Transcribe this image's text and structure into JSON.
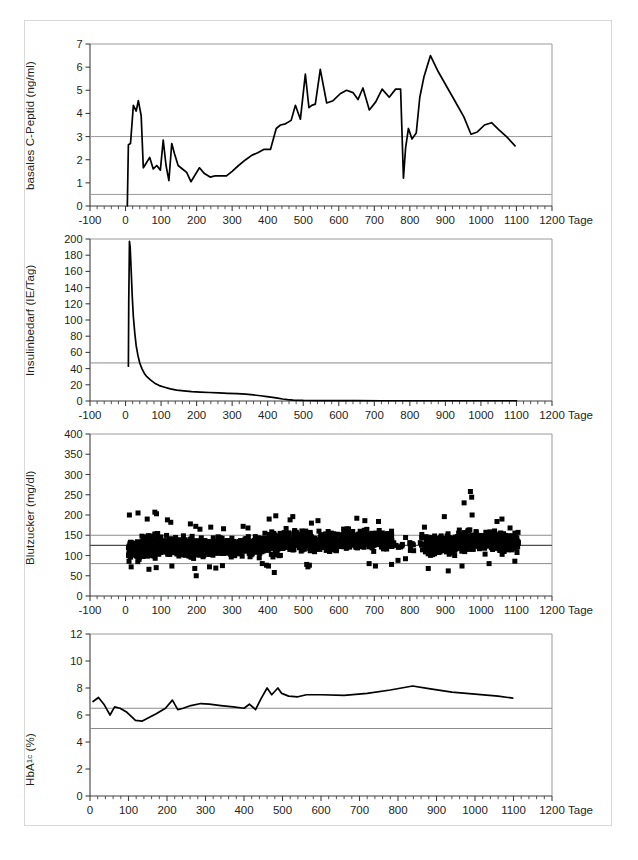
{
  "figure": {
    "background": "#ffffff",
    "border_color": "#d8d8d8",
    "line_color": "#000000",
    "ref_line_color": "#8c8c8c",
    "ref_line_dark_color": "#4d4d4d",
    "axis_color": "#3f3f3f",
    "x_unit_label": "Tage"
  },
  "chart_data": [
    {
      "id": "c-peptid",
      "type": "line",
      "title": "",
      "ylabel": "basales C-Peptid (ng/ml)",
      "xlabel": "Tage",
      "xlim": [
        -100,
        1200
      ],
      "ylim": [
        0,
        7
      ],
      "xticks": [
        -100,
        0,
        100,
        200,
        300,
        400,
        500,
        600,
        700,
        800,
        900,
        1000,
        1100,
        1200
      ],
      "xticklabels": [
        "-100",
        "0",
        "100",
        "200",
        "300",
        "400",
        "500",
        "600",
        "700",
        "800",
        "900",
        "1000",
        "1100",
        "1200"
      ],
      "yticks": [
        0,
        1,
        2,
        3,
        4,
        5,
        6,
        7
      ],
      "yticklabels": [
        "0",
        "1",
        "2",
        "3",
        "4",
        "5",
        "6",
        "7"
      ],
      "minor_tick_step": 20,
      "grid": false,
      "reference_lines": [
        {
          "y": 3.0,
          "color": "#9a9a9a"
        },
        {
          "y": 0.5,
          "color": "#9a9a9a"
        }
      ],
      "x": [
        5,
        8,
        14,
        22,
        30,
        36,
        44,
        50,
        58,
        68,
        78,
        88,
        98,
        106,
        114,
        122,
        130,
        138,
        148,
        160,
        172,
        184,
        196,
        208,
        222,
        238,
        252,
        268,
        284,
        300,
        318,
        338,
        356,
        372,
        390,
        408,
        424,
        436,
        450,
        466,
        478,
        492,
        506,
        516,
        524,
        534,
        548,
        566,
        584,
        604,
        622,
        640,
        654,
        668,
        686,
        704,
        722,
        742,
        760,
        774,
        782,
        788,
        796,
        806,
        818,
        828,
        840,
        858,
        880,
        906,
        930,
        952,
        972,
        990,
        1010,
        1030,
        1050,
        1072,
        1096
      ],
      "y": [
        0.0,
        2.65,
        2.7,
        4.35,
        4.1,
        4.55,
        3.9,
        1.65,
        1.85,
        2.1,
        1.6,
        1.75,
        1.55,
        2.85,
        1.75,
        1.1,
        2.7,
        2.25,
        1.75,
        1.6,
        1.45,
        1.05,
        1.35,
        1.65,
        1.4,
        1.25,
        1.3,
        1.3,
        1.3,
        1.5,
        1.75,
        2.0,
        2.2,
        2.3,
        2.45,
        2.45,
        3.35,
        3.5,
        3.55,
        3.7,
        4.35,
        3.75,
        5.7,
        4.25,
        4.35,
        4.4,
        5.9,
        4.45,
        4.55,
        4.85,
        5.0,
        4.9,
        4.6,
        5.1,
        4.15,
        4.5,
        5.05,
        4.7,
        5.05,
        5.05,
        1.2,
        2.5,
        3.35,
        2.9,
        3.15,
        4.7,
        5.6,
        6.5,
        5.8,
        5.1,
        4.45,
        3.85,
        3.1,
        3.2,
        3.5,
        3.6,
        3.3,
        3.0,
        2.6
      ]
    },
    {
      "id": "insulinbedarf",
      "type": "line",
      "title": "",
      "ylabel": "Insulinbedarf (IE/Tag)",
      "xlabel": "Tage",
      "xlim": [
        -100,
        1200
      ],
      "ylim": [
        0,
        200
      ],
      "xticks": [
        -100,
        0,
        100,
        200,
        300,
        400,
        500,
        600,
        700,
        800,
        900,
        1000,
        1100,
        1200
      ],
      "xticklabels": [
        "-100",
        "0",
        "100",
        "200",
        "300",
        "400",
        "500",
        "600",
        "700",
        "800",
        "900",
        "1000",
        "1100",
        "1200"
      ],
      "yticks": [
        0,
        20,
        40,
        60,
        80,
        100,
        120,
        140,
        160,
        180,
        200
      ],
      "yticklabels": [
        "0",
        "20",
        "40",
        "60",
        "80",
        "100",
        "120",
        "140",
        "160",
        "180",
        "200"
      ],
      "minor_tick_step": 20,
      "grid": false,
      "reference_lines": [
        {
          "y": 47,
          "color": "#8c8c8c"
        }
      ],
      "x": [
        8,
        9,
        11,
        13,
        16,
        19,
        22,
        26,
        30,
        35,
        40,
        46,
        53,
        60,
        70,
        82,
        95,
        110,
        126,
        144,
        164,
        186,
        210,
        236,
        262,
        288,
        314,
        338,
        360,
        380,
        398,
        414,
        428,
        442,
        456,
        472,
        500,
        540,
        590,
        650,
        720,
        800,
        880,
        960,
        1040,
        1100
      ],
      "y": [
        43,
        120,
        197,
        190,
        160,
        128,
        104,
        84,
        68,
        56,
        47,
        40,
        34,
        30,
        26,
        22,
        19,
        17,
        15,
        13.5,
        12.5,
        11.5,
        11,
        10.5,
        10,
        9.5,
        9,
        8.5,
        7.5,
        6.5,
        5.5,
        4.5,
        3.5,
        2.5,
        1.8,
        1.2,
        0.7,
        0.5,
        0.4,
        0.35,
        0.3,
        0.3,
        0.3,
        0.3,
        0.3,
        0.3
      ]
    },
    {
      "id": "blutzucker",
      "type": "scatter",
      "title": "",
      "ylabel": "Blutzucker (mg/dl)",
      "xlabel": "Tage",
      "xlim": [
        -100,
        1200
      ],
      "ylim": [
        0,
        400
      ],
      "xticks": [
        -100,
        0,
        100,
        200,
        300,
        400,
        500,
        600,
        700,
        800,
        900,
        1000,
        1100,
        1200
      ],
      "xticklabels": [
        "-100",
        "0",
        "100",
        "200",
        "300",
        "400",
        "500",
        "600",
        "700",
        "800",
        "900",
        "1000",
        "1100",
        "1200"
      ],
      "yticks": [
        0,
        50,
        100,
        150,
        200,
        250,
        300,
        350,
        400
      ],
      "yticklabels": [
        "0",
        "50",
        "100",
        "150",
        "200",
        "250",
        "300",
        "350",
        "400"
      ],
      "minor_tick_step": 20,
      "grid": false,
      "marker": "square",
      "marker_size": 5,
      "reference_lines": [
        {
          "y": 150,
          "color": "#8c8c8c"
        },
        {
          "y": 125,
          "color": "#4d4d4d"
        },
        {
          "y": 80,
          "color": "#8c8c8c"
        }
      ],
      "point_count": 1600,
      "cloud_segments": [
        {
          "x_start": 8,
          "x_end": 45,
          "mean": 112,
          "spread": 26,
          "density": 120,
          "outliers_high": [
            205,
            200
          ],
          "outliers_low": [
            72
          ]
        },
        {
          "x_start": 45,
          "x_end": 95,
          "mean": 124,
          "spread": 32,
          "density": 150,
          "outliers_high": [
            207,
            203,
            190
          ],
          "outliers_low": [
            70,
            66
          ]
        },
        {
          "x_start": 95,
          "x_end": 150,
          "mean": 123,
          "spread": 30,
          "density": 140,
          "outliers_high": [
            182,
            188
          ],
          "outliers_low": [
            74
          ]
        },
        {
          "x_start": 150,
          "x_end": 200,
          "mean": 120,
          "spread": 29,
          "density": 130,
          "outliers_high": [
            178,
            172
          ],
          "outliers_low": [
            50,
            68
          ]
        },
        {
          "x_start": 200,
          "x_end": 260,
          "mean": 119,
          "spread": 28,
          "density": 135,
          "outliers_high": [
            170,
            165
          ],
          "outliers_low": [
            69,
            72
          ]
        },
        {
          "x_start": 260,
          "x_end": 330,
          "mean": 121,
          "spread": 28,
          "density": 140,
          "outliers_high": [
            166
          ],
          "outliers_low": [
            75
          ]
        },
        {
          "x_start": 330,
          "x_end": 400,
          "mean": 124,
          "spread": 30,
          "density": 140,
          "outliers_high": [
            172,
            168
          ],
          "outliers_low": [
            76,
            80
          ]
        },
        {
          "x_start": 400,
          "x_end": 440,
          "mean": 130,
          "spread": 34,
          "density": 110,
          "outliers_high": [
            198,
            190
          ],
          "outliers_low": [
            58,
            74
          ]
        },
        {
          "x_start": 440,
          "x_end": 510,
          "mean": 136,
          "spread": 33,
          "density": 150,
          "outliers_high": [
            196,
            188
          ],
          "outliers_low": [
            78
          ]
        },
        {
          "x_start": 510,
          "x_end": 600,
          "mean": 133,
          "spread": 32,
          "density": 160,
          "outliers_high": [
            186,
            180
          ],
          "outliers_low": [
            76,
            72
          ]
        },
        {
          "x_start": 600,
          "x_end": 690,
          "mean": 137,
          "spread": 33,
          "density": 165,
          "outliers_high": [
            192,
            186
          ],
          "outliers_low": [
            80
          ]
        },
        {
          "x_start": 690,
          "x_end": 750,
          "mean": 136,
          "spread": 31,
          "density": 120,
          "outliers_high": [
            184
          ],
          "outliers_low": [
            78,
            74
          ]
        },
        {
          "x_start": 750,
          "x_end": 840,
          "mean": 126,
          "spread": 22,
          "density": 18,
          "outliers_high": [
            152
          ],
          "outliers_low": [
            88,
            92
          ]
        },
        {
          "x_start": 840,
          "x_end": 930,
          "mean": 128,
          "spread": 32,
          "density": 150,
          "outliers_high": [
            196,
            170
          ],
          "outliers_low": [
            68,
            62
          ]
        },
        {
          "x_start": 930,
          "x_end": 1000,
          "mean": 136,
          "spread": 34,
          "density": 150,
          "outliers_high": [
            258,
            244,
            230,
            200
          ],
          "outliers_low": [
            74
          ]
        },
        {
          "x_start": 1000,
          "x_end": 1060,
          "mean": 134,
          "spread": 31,
          "density": 130,
          "outliers_high": [
            190,
            184
          ],
          "outliers_low": [
            80
          ]
        },
        {
          "x_start": 1060,
          "x_end": 1105,
          "mean": 130,
          "spread": 26,
          "density": 110,
          "outliers_high": [
            168
          ],
          "outliers_low": [
            86
          ]
        }
      ]
    },
    {
      "id": "hba1c",
      "type": "line",
      "title": "",
      "ylabel": "HbA1c (%)",
      "ylabel_main": "HbA",
      "ylabel_sub": "1c",
      "ylabel_tail": " (%)",
      "xlabel": "Tage",
      "xlim": [
        0,
        1200
      ],
      "ylim": [
        0,
        12
      ],
      "xticks": [
        0,
        100,
        200,
        300,
        400,
        500,
        600,
        700,
        800,
        900,
        1000,
        1100,
        1200
      ],
      "xticklabels": [
        "0",
        "100",
        "200",
        "300",
        "400",
        "500",
        "600",
        "700",
        "800",
        "900",
        "1000",
        "1100",
        "1200"
      ],
      "yticks": [
        0,
        2,
        4,
        6,
        8,
        10,
        12
      ],
      "yticklabels": [
        "0",
        "2",
        "4",
        "6",
        "8",
        "10",
        "12"
      ],
      "minor_tick_step": 20,
      "grid": false,
      "reference_lines": [
        {
          "y": 6.5,
          "color": "#8c8c8c"
        },
        {
          "y": 5.0,
          "color": "#8c8c8c"
        }
      ],
      "x": [
        8,
        22,
        36,
        52,
        64,
        78,
        96,
        118,
        136,
        152,
        172,
        196,
        214,
        228,
        242,
        262,
        288,
        310,
        340,
        372,
        400,
        414,
        430,
        444,
        460,
        472,
        488,
        498,
        516,
        540,
        562,
        600,
        660,
        720,
        780,
        838,
        880,
        940,
        1000,
        1060,
        1098
      ],
      "y": [
        7.0,
        7.3,
        6.8,
        6.0,
        6.6,
        6.5,
        6.2,
        5.6,
        5.55,
        5.8,
        6.1,
        6.5,
        7.1,
        6.4,
        6.5,
        6.7,
        6.85,
        6.8,
        6.7,
        6.6,
        6.5,
        6.8,
        6.4,
        7.2,
        8.0,
        7.5,
        8.0,
        7.6,
        7.4,
        7.35,
        7.5,
        7.5,
        7.45,
        7.6,
        7.85,
        8.15,
        7.95,
        7.7,
        7.55,
        7.4,
        7.25
      ]
    }
  ]
}
